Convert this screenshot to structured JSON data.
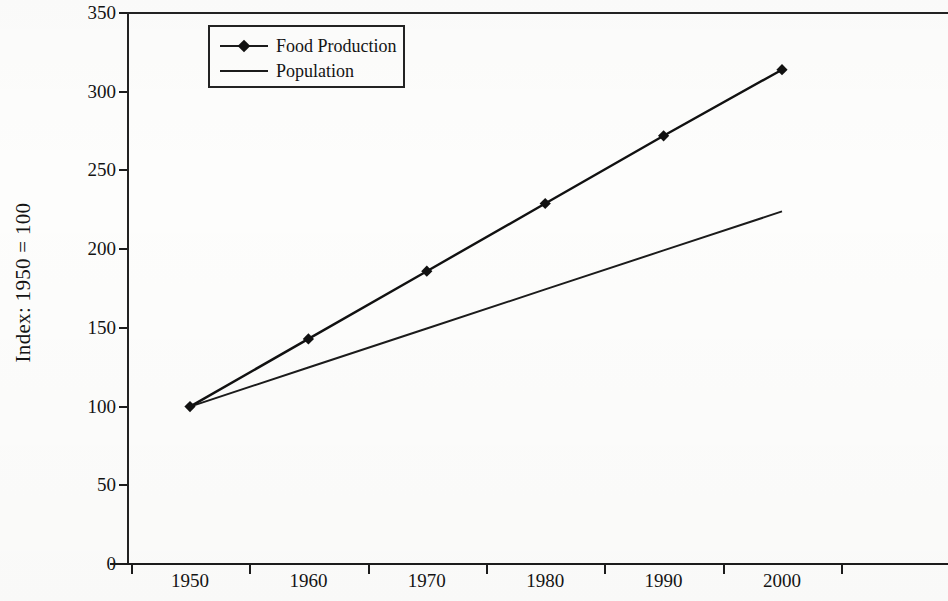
{
  "chart_data": {
    "type": "line",
    "title": "",
    "subtitle": "",
    "xlabel": "",
    "ylabel": "Index: 1950 = 100",
    "categories": [
      "1950",
      "1960",
      "1970",
      "1980",
      "1990",
      "2000"
    ],
    "x": [
      1950,
      1960,
      1970,
      1980,
      1990,
      2000
    ],
    "series": [
      {
        "name": "Food Production",
        "values": [
          100,
          143,
          186,
          229,
          272,
          314
        ],
        "marker": "diamond",
        "color": "#111111"
      },
      {
        "name": "Population",
        "values": [
          100,
          124.8,
          149.6,
          174.4,
          199.2,
          224
        ],
        "marker": "none",
        "color": "#1b1b1b"
      }
    ],
    "ylim": [
      0,
      350
    ],
    "yticks": [
      0,
      50,
      100,
      150,
      200,
      250,
      300,
      350
    ],
    "ytick_labels": [
      "0",
      "50",
      "100",
      "150",
      "200",
      "250",
      "300",
      "350"
    ],
    "xtick_labels": [
      "1950",
      "1960",
      "1970",
      "1980",
      "1990",
      "2000"
    ],
    "grid": false,
    "legend_position": "top-left",
    "frame": "top-left-bottom"
  },
  "axes": {
    "y_title": "Index: 1950 = 100",
    "y_ticks": [
      {
        "label": "350",
        "value": 350
      },
      {
        "label": "300",
        "value": 300
      },
      {
        "label": "250",
        "value": 250
      },
      {
        "label": "200",
        "value": 200
      },
      {
        "label": "150",
        "value": 150
      },
      {
        "label": "100",
        "value": 100
      },
      {
        "label": "50",
        "value": 50
      },
      {
        "label": "0",
        "value": 0
      }
    ],
    "x_ticks": [
      {
        "label": "1950"
      },
      {
        "label": "1960"
      },
      {
        "label": "1970"
      },
      {
        "label": "1980"
      },
      {
        "label": "1990"
      },
      {
        "label": "2000"
      }
    ]
  },
  "legend": {
    "items": [
      {
        "label": "Food Production",
        "marker": "diamond"
      },
      {
        "label": "Population",
        "marker": "line"
      }
    ]
  },
  "colors": {
    "ink": "#1b1b1b",
    "paper": "#fdfdfc",
    "series_food": "#111111",
    "series_population": "#1b1b1b"
  }
}
